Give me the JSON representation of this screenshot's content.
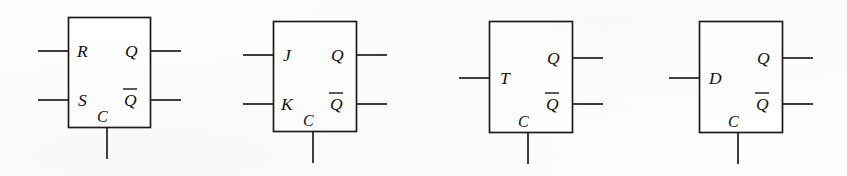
{
  "figure": {
    "background_color": "#fdfdfb",
    "line_color": "#1a1a1a",
    "text_color": "#111111",
    "flipflops": [
      {
        "name": "rs-flip-flop",
        "inputs": [
          {
            "label": "R",
            "name": "input-r"
          },
          {
            "label": "S",
            "name": "input-s"
          }
        ],
        "clock": {
          "label": "C",
          "name": "clock-input-c"
        },
        "outputs": [
          {
            "label": "Q",
            "name": "output-q",
            "overbar": false
          },
          {
            "label": "Q",
            "name": "output-q-bar",
            "overbar": true
          }
        ]
      },
      {
        "name": "jk-flip-flop",
        "inputs": [
          {
            "label": "J",
            "name": "input-j"
          },
          {
            "label": "K",
            "name": "input-k"
          }
        ],
        "clock": {
          "label": "C",
          "name": "clock-input-c"
        },
        "outputs": [
          {
            "label": "Q",
            "name": "output-q",
            "overbar": false
          },
          {
            "label": "Q",
            "name": "output-q-bar",
            "overbar": true
          }
        ]
      },
      {
        "name": "t-flip-flop",
        "inputs": [
          {
            "label": "T",
            "name": "input-t"
          }
        ],
        "clock": {
          "label": "C",
          "name": "clock-input-c"
        },
        "outputs": [
          {
            "label": "Q",
            "name": "output-q",
            "overbar": false
          },
          {
            "label": "Q",
            "name": "output-q-bar",
            "overbar": true
          }
        ]
      },
      {
        "name": "d-flip-flop",
        "inputs": [
          {
            "label": "D",
            "name": "input-d"
          }
        ],
        "clock": {
          "label": "C",
          "name": "clock-input-c"
        },
        "outputs": [
          {
            "label": "Q",
            "name": "output-q",
            "overbar": false
          },
          {
            "label": "Q",
            "name": "output-q-bar",
            "overbar": true
          }
        ]
      }
    ]
  }
}
